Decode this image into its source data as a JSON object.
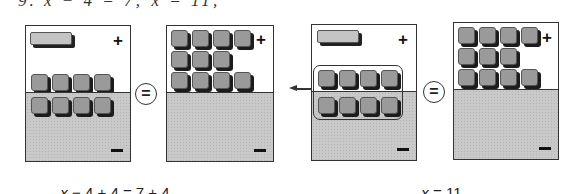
{
  "problem": {
    "header_partial": "9. x − 4 = 7; x = 11;"
  },
  "colors": {
    "border": "#333333",
    "negative_region": "#c9c9c9",
    "unit_tile": "#9a9a9a",
    "x_tile": "#c4c4c4"
  },
  "mats": [
    {
      "id": "mat-1",
      "positive_label": "+",
      "negative_label": "−",
      "positive_tiles": {
        "x_tiles": 1,
        "unit_tiles": 4
      },
      "negative_tiles": {
        "unit_tiles": 4
      }
    },
    {
      "id": "mat-2",
      "positive_label": "+",
      "negative_label": "−",
      "positive_tiles": {
        "unit_tiles": 11,
        "rows": [
          4,
          3,
          4
        ]
      },
      "negative_tiles": {
        "unit_tiles": 0
      }
    },
    {
      "id": "mat-3",
      "positive_label": "+",
      "negative_label": "−",
      "positive_tiles": {
        "x_tiles": 1,
        "unit_tiles": 4
      },
      "negative_tiles": {
        "unit_tiles": 4
      },
      "grouped_zero_pairs": 4,
      "arrow": "remove-left"
    },
    {
      "id": "mat-4",
      "positive_label": "+",
      "negative_label": "−",
      "positive_tiles": {
        "unit_tiles": 11,
        "rows": [
          4,
          3,
          4
        ]
      },
      "negative_tiles": {
        "unit_tiles": 0
      }
    }
  ],
  "equals_symbol": "=",
  "equations": [
    {
      "var": "x",
      "rest": " − 4 + 4 = 7 + 4"
    },
    {
      "var": "x",
      "rest": " = 11"
    }
  ]
}
